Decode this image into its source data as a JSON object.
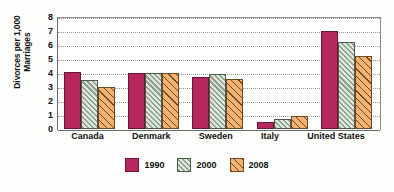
{
  "chart_data": {
    "type": "bar",
    "title": "",
    "xlabel": "",
    "ylabel": "Divorces per 1,000\nMarriages",
    "ylim": [
      0,
      8
    ],
    "yticks": [
      0,
      1,
      2,
      3,
      4,
      5,
      6,
      7,
      8
    ],
    "ytick_labels": [
      "0",
      "1",
      "2",
      "3",
      "4",
      "5",
      "6",
      "7",
      "8"
    ],
    "grid": true,
    "legend_position": "bottom-center",
    "categories": [
      "Canada",
      "Denmark",
      "Sweden",
      "Italy",
      "United States"
    ],
    "series": [
      {
        "name": "1990",
        "color": "#b5275d",
        "fill": "solid",
        "values": [
          4.1,
          4.0,
          3.7,
          0.5,
          7.0
        ]
      },
      {
        "name": "2000",
        "color": "#8fa38c",
        "fill": "diagonal-hatch",
        "values": [
          3.5,
          4.0,
          3.9,
          0.7,
          6.2
        ]
      },
      {
        "name": "2008",
        "color": "#f3b271",
        "fill": "cross-hatch",
        "values": [
          3.0,
          4.0,
          3.6,
          0.9,
          5.2
        ]
      }
    ]
  }
}
